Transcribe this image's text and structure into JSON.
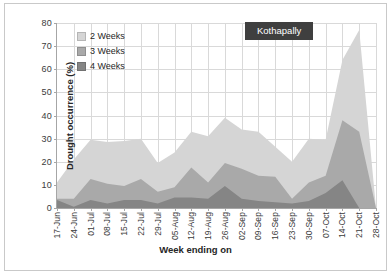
{
  "chart_data": {
    "type": "area",
    "title": "Kothapally",
    "xlabel": "Week ending on",
    "ylabel": "Drought occurrence (%)",
    "ylim": [
      0,
      80
    ],
    "ytick_step": 10,
    "yticks": [
      0,
      10,
      20,
      30,
      40,
      50,
      60,
      70,
      80
    ],
    "grid": true,
    "legend_position": "top-left-inside",
    "stacked": false,
    "categories": [
      "17-Jun",
      "24-Jun",
      "01-Jul",
      "08-Jul",
      "15-Jul",
      "22-Jul",
      "29-Jul",
      "05-Aug",
      "12-Aug",
      "19-Aug",
      "26-Aug",
      "02-Sep",
      "09-Sep",
      "16-Sep",
      "23-Sep",
      "30-Sep",
      "07-Oct",
      "14-Oct",
      "21-Oct",
      "28-Oct"
    ],
    "series": [
      {
        "name": "2 Weeks",
        "color": "#d5d5d5",
        "values": [
          11,
          21,
          29.5,
          28.5,
          29,
          30,
          19.5,
          24,
          33,
          31,
          39,
          34,
          33,
          26.5,
          20,
          30,
          29.5,
          64,
          77,
          0
        ]
      },
      {
        "name": "3 Weeks",
        "color": "#a9a9a9",
        "values": [
          4,
          4,
          12.5,
          10.5,
          9.5,
          12.5,
          7,
          9,
          17.5,
          11,
          19.5,
          17,
          14,
          13.5,
          4,
          11,
          14,
          38,
          33,
          0
        ]
      },
      {
        "name": "4 Weeks",
        "color": "#858585",
        "values": [
          3.5,
          0.5,
          3.5,
          2,
          3.5,
          3.5,
          2,
          4.5,
          4.5,
          4,
          9.5,
          4,
          3,
          2.5,
          2,
          3,
          6.5,
          12,
          0,
          0
        ]
      }
    ]
  },
  "legend": {
    "items": [
      {
        "label": "2 Weeks"
      },
      {
        "label": "3 Weeks"
      },
      {
        "label": "4 Weeks"
      }
    ]
  }
}
